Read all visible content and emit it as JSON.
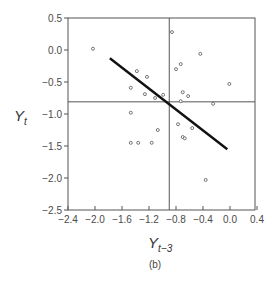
{
  "caption": "(b)",
  "chart_data": {
    "type": "scatter",
    "title": "",
    "xlabel": "Y",
    "xlabel_sub": "t−3",
    "ylabel": "Y",
    "ylabel_sub": "t",
    "xlim": [
      -2.4,
      0.4
    ],
    "ylim": [
      -2.5,
      0.5
    ],
    "xticks": [
      -2.4,
      -2.0,
      -1.6,
      -1.2,
      -0.8,
      -0.4,
      0.0,
      0.4
    ],
    "xtick_labels": [
      "−2.4",
      "−2.0",
      "−1.6",
      "−1.2",
      "−0.8",
      "−0.4",
      "0.0",
      "0.4"
    ],
    "yticks": [
      0.5,
      0.0,
      -0.5,
      -1.0,
      -1.5,
      -2.0,
      -2.5
    ],
    "ytick_labels": [
      "0.5",
      "0.0",
      "−0.5",
      "−1.0",
      "−1.5",
      "−2.0",
      "−2.5"
    ],
    "grid": false,
    "legend": null,
    "reference_lines": {
      "vertical_x": -0.9,
      "horizontal_y": -0.81
    },
    "fit_line": {
      "x": [
        -1.78,
        -0.04
      ],
      "y": [
        -0.13,
        -1.55
      ]
    },
    "series": [
      {
        "name": "observations",
        "marker": "open-circle",
        "points": [
          [
            -2.03,
            0.02
          ],
          [
            -1.38,
            -0.33
          ],
          [
            -1.23,
            -0.42
          ],
          [
            -1.47,
            -0.59
          ],
          [
            -1.26,
            -0.69
          ],
          [
            -1.11,
            -0.75
          ],
          [
            -0.99,
            -0.7
          ],
          [
            -0.86,
            0.28
          ],
          [
            -0.44,
            -0.06
          ],
          [
            -0.73,
            -0.22
          ],
          [
            -0.8,
            -0.3
          ],
          [
            -0.01,
            -0.53
          ],
          [
            -0.7,
            -0.66
          ],
          [
            -0.62,
            -0.72
          ],
          [
            -0.73,
            -0.8
          ],
          [
            -0.25,
            -0.84
          ],
          [
            -1.47,
            -0.98
          ],
          [
            -0.77,
            -1.16
          ],
          [
            -0.56,
            -1.22
          ],
          [
            -1.07,
            -1.25
          ],
          [
            -0.7,
            -1.36
          ],
          [
            -0.67,
            -1.38
          ],
          [
            -1.47,
            -1.45
          ],
          [
            -1.36,
            -1.45
          ],
          [
            -1.16,
            -1.45
          ],
          [
            -0.36,
            -2.03
          ]
        ]
      }
    ]
  }
}
